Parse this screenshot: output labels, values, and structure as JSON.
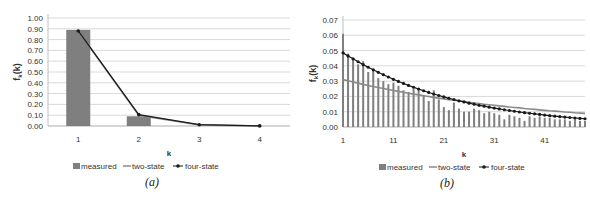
{
  "chart_data": [
    {
      "type": "bar",
      "panel_label": "(a)",
      "title": "",
      "xlabel": "k",
      "ylabel": "f_k(k)",
      "ylim": [
        0,
        1.0
      ],
      "yticks": [
        "0.00",
        "0.10",
        "0.20",
        "0.30",
        "0.40",
        "0.50",
        "0.60",
        "0.70",
        "0.80",
        "0.90",
        "1.00"
      ],
      "categories": [
        "1",
        "2",
        "3",
        "4"
      ],
      "grid": true,
      "legend_position": "bottom",
      "series": [
        {
          "name": "measured",
          "kind": "bar",
          "values": [
            0.89,
            0.09,
            0.0,
            0.0
          ]
        },
        {
          "name": "two-state",
          "kind": "line",
          "values": [
            0.88,
            0.1,
            0.01,
            0.0
          ]
        },
        {
          "name": "four-state",
          "kind": "line-marker",
          "values": [
            0.88,
            0.105,
            0.012,
            0.001
          ]
        }
      ]
    },
    {
      "type": "bar",
      "panel_label": "(b)",
      "title": "",
      "xlabel": "k",
      "ylabel": "f_k(k)",
      "ylim": [
        0,
        0.07
      ],
      "yticks": [
        "0.00",
        "0.01",
        "0.02",
        "0.03",
        "0.04",
        "0.05",
        "0.06",
        "0.07"
      ],
      "xticks": [
        "1",
        "11",
        "21",
        "31",
        "41"
      ],
      "categories": [
        "1",
        "2",
        "3",
        "4",
        "5",
        "6",
        "7",
        "8",
        "9",
        "10",
        "11",
        "12",
        "13",
        "14",
        "15",
        "16",
        "17",
        "18",
        "19",
        "20",
        "21",
        "22",
        "23",
        "24",
        "25",
        "26",
        "27",
        "28",
        "29",
        "30",
        "31",
        "32",
        "33",
        "34",
        "35",
        "36",
        "37",
        "38",
        "39",
        "40",
        "41",
        "42",
        "43",
        "44",
        "45",
        "46",
        "47",
        "48",
        "49"
      ],
      "grid": true,
      "legend_position": "bottom",
      "series": [
        {
          "name": "measured",
          "kind": "bar",
          "values": [
            0.061,
            0.048,
            0.045,
            0.041,
            0.043,
            0.036,
            0.038,
            0.032,
            0.03,
            0.028,
            0.029,
            0.027,
            0.024,
            0.023,
            0.025,
            0.024,
            0.021,
            0.017,
            0.024,
            0.018,
            0.013,
            0.011,
            0.016,
            0.012,
            0.01,
            0.01,
            0.012,
            0.011,
            0.009,
            0.01,
            0.009,
            0.008,
            0.005,
            0.008,
            0.007,
            0.006,
            0.004,
            0.007,
            0.006,
            0.007,
            0.006,
            0.006,
            0.005,
            0.005,
            0.005,
            0.004,
            0.005,
            0.004,
            0.004
          ]
        },
        {
          "name": "two-state",
          "kind": "line",
          "values": [
            0.031,
            0.0302,
            0.0294,
            0.0287,
            0.0279,
            0.0272,
            0.0265,
            0.0258,
            0.0252,
            0.0245,
            0.0239,
            0.0233,
            0.0227,
            0.0221,
            0.0215,
            0.021,
            0.0204,
            0.0199,
            0.0194,
            0.0189,
            0.0184,
            0.0179,
            0.0175,
            0.017,
            0.0166,
            0.0162,
            0.0157,
            0.0153,
            0.0149,
            0.0146,
            0.0142,
            0.0138,
            0.0135,
            0.0131,
            0.0128,
            0.0125,
            0.0121,
            0.0118,
            0.0115,
            0.0112,
            0.0109,
            0.0106,
            0.0104,
            0.0101,
            0.0098,
            0.0096,
            0.0093,
            0.0091,
            0.0089
          ]
        },
        {
          "name": "four-state",
          "kind": "line-marker",
          "values": [
            0.0485,
            0.0465,
            0.0446,
            0.0427,
            0.0408,
            0.0391,
            0.0374,
            0.0358,
            0.0342,
            0.0327,
            0.0312,
            0.0298,
            0.0285,
            0.0272,
            0.026,
            0.0248,
            0.0237,
            0.0226,
            0.0216,
            0.0206,
            0.0197,
            0.0188,
            0.018,
            0.0171,
            0.0164,
            0.0156,
            0.0149,
            0.0142,
            0.0136,
            0.013,
            0.0124,
            0.0118,
            0.0113,
            0.0108,
            0.0103,
            0.0098,
            0.0094,
            0.009,
            0.0086,
            0.0082,
            0.0078,
            0.0074,
            0.0071,
            0.0068,
            0.0065,
            0.0062,
            0.0059,
            0.0056,
            0.0054
          ]
        }
      ]
    }
  ],
  "legend": {
    "measured": "measured",
    "two_state": "two-state",
    "four_state": "four-state"
  },
  "captions": {
    "a": "(a)",
    "b": "(b)"
  },
  "axis": {
    "xlabel": "k",
    "ylabel_main": "f",
    "ylabel_sub": "k",
    "ylabel_paren": "(k)"
  },
  "colors": {
    "bar": "#7f7f7f",
    "two_state": "#8a8a8a",
    "four_state": "#1a1a1a",
    "grid": "#d9d9d9",
    "axis": "#bfbfbf"
  }
}
